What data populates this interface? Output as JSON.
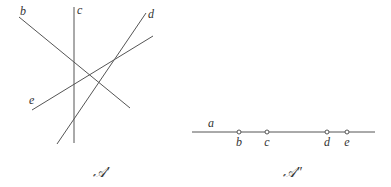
{
  "left_figure": {
    "caption": "𝒜′",
    "lines": [
      {
        "name": "b",
        "x1": 19,
        "y1": 17,
        "x2": 130,
        "y2": 108,
        "label_x": 20,
        "label_y": 15
      },
      {
        "name": "c",
        "x1": 74,
        "y1": 7,
        "x2": 74,
        "y2": 143,
        "label_x": 77,
        "label_y": 14
      },
      {
        "name": "d",
        "x1": 146,
        "y1": 13,
        "x2": 57,
        "y2": 144,
        "label_x": 148,
        "label_y": 18
      },
      {
        "name": "e",
        "x1": 32,
        "y1": 110,
        "x2": 153,
        "y2": 36,
        "label_x": 29,
        "label_y": 104
      }
    ]
  },
  "right_figure": {
    "caption": "𝒜″",
    "line": {
      "name": "a",
      "x1": 192,
      "y1": 132,
      "x2": 375,
      "y2": 132,
      "label_x": 208,
      "label_y": 127
    },
    "points": [
      {
        "name": "b",
        "x": 239
      },
      {
        "name": "c",
        "x": 267
      },
      {
        "name": "d",
        "x": 327
      },
      {
        "name": "e",
        "x": 347
      }
    ]
  }
}
